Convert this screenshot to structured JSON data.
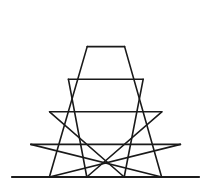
{
  "diagram": {
    "type": "subdivided-equilateral-triangle",
    "rows": 5,
    "small_triangles_count": 25,
    "line_color": "#1a1a1a",
    "background_color": "#ffffff",
    "geometry": {
      "apex": [
        106,
        14
      ],
      "base_left": [
        12,
        177
      ],
      "base_right": [
        199,
        177
      ]
    }
  }
}
